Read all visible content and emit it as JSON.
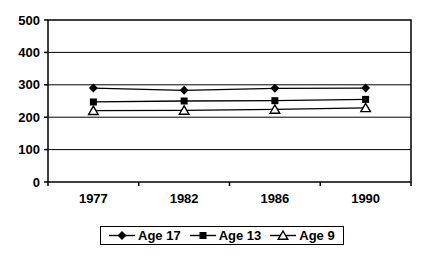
{
  "chart_data": {
    "type": "line",
    "title": "",
    "xlabel": "",
    "ylabel": "",
    "categories": [
      "1977",
      "1982",
      "1986",
      "1990"
    ],
    "series": [
      {
        "name": "Age 17",
        "marker": "diamond",
        "values": [
          290,
          283,
          289,
          290
        ]
      },
      {
        "name": "Age 13",
        "marker": "square",
        "values": [
          247,
          250,
          251,
          255
        ]
      },
      {
        "name": "Age 9",
        "marker": "triangle-open",
        "values": [
          220,
          221,
          224,
          229
        ]
      }
    ],
    "ylim": [
      0,
      500
    ],
    "ytick_values": [
      0,
      100,
      200,
      300,
      400,
      500
    ],
    "ytick_labels": [
      "0",
      "100",
      "200",
      "300",
      "400",
      "500"
    ],
    "grid": true,
    "legend_position": "bottom",
    "colors": {
      "line": "#000000",
      "text": "#000000",
      "background": "#ffffff",
      "marker_open_fill": "#ffffff"
    }
  }
}
